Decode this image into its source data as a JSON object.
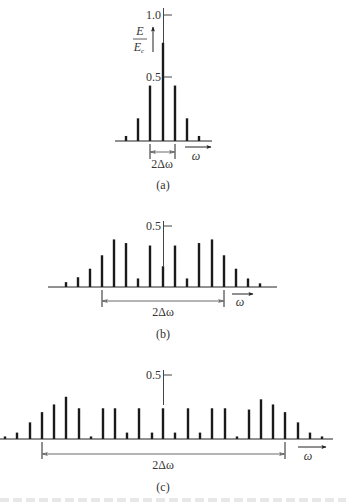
{
  "panels": [
    {
      "id": "a",
      "caption": "(a)",
      "y_label_num": "E",
      "y_label_den": "E",
      "y_label_sub": "c",
      "tick_1": "1.0",
      "tick_05": "0.5",
      "span_label": "2Δω",
      "x_label": "ω",
      "geom": {
        "baseline": 141,
        "axis_x": 163,
        "px_per_unit": 126,
        "x_start": 115,
        "x_end": 212,
        "span_from": 150,
        "span_to": 175,
        "span_y": 152,
        "span_label_y": 167,
        "omega_arrow": [
          185,
          211,
          147
        ],
        "omega_label": [
          197,
          160
        ],
        "caption_y": 188,
        "tick_1_y": 15,
        "tick_05_y": 77,
        "axis_top": 8
      }
    },
    {
      "id": "b",
      "caption": "(b)",
      "tick_05": "0.5",
      "span_label": "2Δω",
      "x_label": "ω",
      "geom": {
        "baseline": 287,
        "axis_x": 163,
        "px_per_unit": 122,
        "x_start": 48,
        "x_end": 277,
        "span_from": 102,
        "span_to": 224,
        "span_y": 301,
        "span_label_y": 315,
        "omega_arrow": [
          232,
          253,
          294
        ],
        "omega_label": [
          241,
          306
        ],
        "caption_y": 337,
        "tick_05_y": 226,
        "axis_top": 221
      }
    },
    {
      "id": "c",
      "caption": "(c)",
      "tick_05": "0.5",
      "span_label": "2Δω",
      "x_label": "ω",
      "geom": {
        "baseline": 439,
        "axis_x": 163,
        "px_per_unit": 128,
        "x_start": 0,
        "x_end": 333,
        "span_from": 42,
        "span_to": 285,
        "span_y": 454,
        "span_label_y": 468,
        "omega_arrow": [
          298,
          326,
          447
        ],
        "omega_label": [
          308,
          460
        ],
        "caption_y": 491,
        "tick_05_y": 375,
        "axis_top": 370
      }
    }
  ],
  "chart_data": [
    {
      "type": "bar",
      "title": "(a)",
      "ylabel": "E/Ec",
      "xlabel": "ω",
      "ylim": [
        0,
        1.0
      ],
      "yticks": [
        0.5,
        1.0
      ],
      "annotation": "2Δω",
      "x": [
        126,
        138,
        150,
        163,
        175,
        187,
        199
      ],
      "values": [
        0.04,
        0.18,
        0.44,
        0.78,
        0.44,
        0.18,
        0.04
      ]
    },
    {
      "type": "bar",
      "title": "(b)",
      "xlabel": "ω",
      "yticks": [
        0.5
      ],
      "annotation": "2Δω",
      "x": [
        66,
        78,
        90,
        102,
        114,
        126,
        138,
        150,
        163,
        175,
        187,
        199,
        212,
        224,
        236,
        248,
        260
      ],
      "values": [
        0.04,
        0.08,
        0.15,
        0.26,
        0.39,
        0.36,
        0.07,
        0.34,
        0.17,
        0.34,
        0.07,
        0.36,
        0.39,
        0.26,
        0.15,
        0.07,
        0.03
      ]
    },
    {
      "type": "bar",
      "title": "(c)",
      "xlabel": "ω",
      "yticks": [
        0.5
      ],
      "annotation": "2Δω",
      "x": [
        5,
        17,
        30,
        42,
        54,
        66,
        79,
        91,
        103,
        115,
        127,
        139,
        152,
        163,
        175,
        188,
        200,
        212,
        225,
        237,
        249,
        261,
        273,
        285,
        298,
        310,
        322
      ],
      "values": [
        0.02,
        0.05,
        0.13,
        0.21,
        0.27,
        0.33,
        0.24,
        0.02,
        0.24,
        0.24,
        0.05,
        0.24,
        0.05,
        0.24,
        0.05,
        0.24,
        0.05,
        0.24,
        0.24,
        0.02,
        0.23,
        0.31,
        0.27,
        0.21,
        0.13,
        0.05,
        0.02
      ]
    }
  ]
}
